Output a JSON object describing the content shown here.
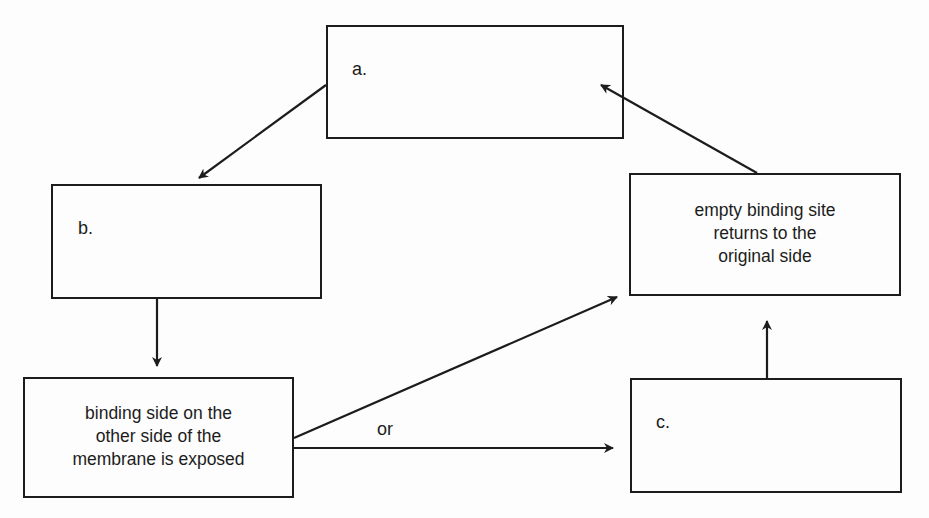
{
  "diagram": {
    "type": "flowchart",
    "nodes": [
      {
        "id": "a",
        "label": "a.",
        "text": ""
      },
      {
        "id": "b",
        "label": "b.",
        "text": ""
      },
      {
        "id": "exposed",
        "label": "",
        "lines": [
          "binding side on the",
          "other side of the",
          "membrane is exposed"
        ]
      },
      {
        "id": "returns",
        "label": "",
        "lines": [
          "empty binding site",
          "returns to the",
          "original side"
        ]
      },
      {
        "id": "c",
        "label": "c.",
        "text": ""
      }
    ],
    "edges": [
      {
        "from": "a",
        "to": "b"
      },
      {
        "from": "b",
        "to": "exposed"
      },
      {
        "from": "exposed",
        "to": "returns"
      },
      {
        "from": "exposed",
        "to": "c"
      },
      {
        "from": "c",
        "to": "returns"
      },
      {
        "from": "returns",
        "to": "a"
      }
    ],
    "annotations": {
      "or_label": "or"
    },
    "colors": {
      "stroke": "#1c1c1c",
      "background": "#fdfdfd"
    }
  }
}
